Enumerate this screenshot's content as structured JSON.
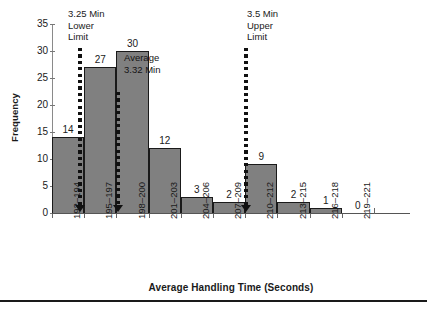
{
  "chart_data": {
    "type": "bar",
    "title": "",
    "subtitle": "",
    "xlabel": "Average Handling Time (Seconds)",
    "ylabel": "Frequency",
    "categories": [
      "192–194",
      "195–197",
      "198–200",
      "201–203",
      "204–206",
      "207–209",
      "210–212",
      "213–215",
      "216–218",
      "219–221"
    ],
    "values": [
      14,
      27,
      30,
      12,
      3,
      2,
      9,
      2,
      1,
      0
    ],
    "value_labels": [
      "14",
      "27",
      "30",
      "12",
      "3",
      "2",
      "9",
      "2",
      "1",
      "0"
    ],
    "ylim": [
      0,
      35
    ],
    "ytick_labels": [
      "0",
      "5",
      "10",
      "15",
      "20",
      "25",
      "30",
      "35"
    ],
    "ytick_values": [
      0,
      5,
      10,
      15,
      20,
      25,
      30,
      35
    ],
    "grid": false,
    "legend": "none",
    "bar_fill_color": "#808080",
    "bar_edge_color": "#1a1a1a",
    "annotation_color": "#111111",
    "annotations": [
      {
        "id": "lower-limit",
        "label": "3.25 Min\nLower\nLimit",
        "label_lines": [
          "3.25 Min",
          "Lower",
          "Limit"
        ],
        "x_position_category_index": 0.86,
        "style": "dotted-arrow-down"
      },
      {
        "id": "average",
        "label": "Average\n3.32 Min",
        "label_lines": [
          "Average",
          "3.32 Min"
        ],
        "x_position_category_index": 2.06,
        "style": "dotted-arrow-down"
      },
      {
        "id": "upper-limit",
        "label": "3.5 Min\nUpper\nLimit",
        "label_lines": [
          "3.5 Min",
          "Upper",
          "Limit"
        ],
        "x_position_category_index": 6.02,
        "style": "dotted-arrow-down"
      }
    ]
  }
}
